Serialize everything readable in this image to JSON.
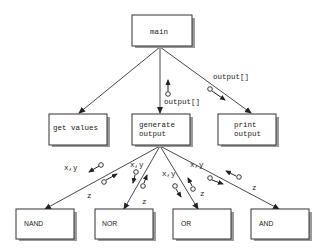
{
  "diagram": {
    "type": "structure-chart",
    "modules": {
      "main": "main",
      "get_values": "get values",
      "generate_output_1": "generate",
      "generate_output_2": "output",
      "print_output_1": "print",
      "print_output_2": "output",
      "nand": "NAND",
      "nor": "NOR",
      "or": "OR",
      "and": "AND"
    },
    "couples": {
      "main_generate": "output[]",
      "main_print": "output[]",
      "nand_in": "x,y",
      "nand_out": "z",
      "nor_in": "x,y",
      "nor_out": "z",
      "or_in": "x,y",
      "or_out": "z",
      "and_in": "x,y",
      "and_out": "z"
    },
    "edges": [
      {
        "from": "main",
        "to": "get values"
      },
      {
        "from": "main",
        "to": "generate output"
      },
      {
        "from": "main",
        "to": "print output"
      },
      {
        "from": "generate output",
        "to": "NAND"
      },
      {
        "from": "generate output",
        "to": "NOR"
      },
      {
        "from": "generate output",
        "to": "OR"
      },
      {
        "from": "generate output",
        "to": "AND"
      }
    ]
  }
}
